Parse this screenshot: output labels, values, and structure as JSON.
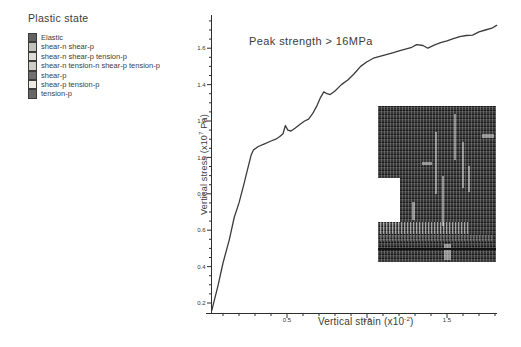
{
  "legend": {
    "title": "Plastic state",
    "items": [
      {
        "label": "Elastic",
        "color": "#636363"
      },
      {
        "label": "shear-n shear-p",
        "color": "#c3c1bd"
      },
      {
        "label": "shear-n shear-p tension-p",
        "color": "#dddcd7"
      },
      {
        "label": "shear-n tension-n shear-p tension-p",
        "color": "#cfcdc8"
      },
      {
        "label": "shear-p",
        "color": "#707070"
      },
      {
        "label": "shear-p tension-p",
        "color": "#edebe6"
      },
      {
        "label": "tension-p",
        "color": "#676765"
      }
    ]
  },
  "chart_data": {
    "type": "line",
    "title": "",
    "annotation": "Peak strength > 16MPa",
    "xlabel": "Vertical strain (x10⁻²)",
    "ylabel": "Vertical stress (x10⁷ Pa)",
    "xlabel_pre": "Vertical strain (x10",
    "xlabel_sup": "-2",
    "xlabel_post": ")",
    "ylabel_pre": "Vertical stress (x10",
    "ylabel_sup": "7",
    "ylabel_post": " Pa)",
    "xlim": [
      0,
      1.82
    ],
    "ylim": [
      0.14,
      1.78
    ],
    "x_ticks": [
      0.5,
      1.0,
      1.5
    ],
    "x_tick_labels": [
      "0.5",
      "1.0",
      "1.5"
    ],
    "x_minor_step": 0.1,
    "y_ticks": [
      0.2,
      0.4,
      0.6,
      0.8,
      1.0,
      1.2,
      1.4,
      1.6
    ],
    "y_tick_labels": [
      "0.2",
      "0.4",
      "0.6",
      "0.8",
      "1.0",
      "1.2",
      "1.4",
      "1.6"
    ],
    "y_minor_step": 0.05,
    "grid": false,
    "legend_position": "top-left",
    "series": [
      {
        "name": "vertical stress vs vertical strain",
        "x": [
          0.03,
          0.07,
          0.1,
          0.14,
          0.17,
          0.2,
          0.23,
          0.255,
          0.275,
          0.29,
          0.32,
          0.36,
          0.4,
          0.43,
          0.455,
          0.475,
          0.49,
          0.505,
          0.525,
          0.55,
          0.58,
          0.61,
          0.635,
          0.66,
          0.685,
          0.71,
          0.73,
          0.75,
          0.77,
          0.8,
          0.84,
          0.88,
          0.92,
          0.96,
          1.0,
          1.04,
          1.08,
          1.12,
          1.16,
          1.2,
          1.24,
          1.28,
          1.31,
          1.35,
          1.38,
          1.42,
          1.46,
          1.5,
          1.54,
          1.58,
          1.62,
          1.66,
          1.7,
          1.74,
          1.78,
          1.81
        ],
        "y": [
          0.16,
          0.3,
          0.42,
          0.55,
          0.67,
          0.75,
          0.85,
          0.94,
          1.01,
          1.04,
          1.06,
          1.075,
          1.09,
          1.1,
          1.115,
          1.13,
          1.175,
          1.15,
          1.145,
          1.16,
          1.18,
          1.2,
          1.21,
          1.24,
          1.28,
          1.33,
          1.36,
          1.35,
          1.345,
          1.365,
          1.4,
          1.425,
          1.46,
          1.5,
          1.525,
          1.545,
          1.555,
          1.565,
          1.575,
          1.585,
          1.595,
          1.605,
          1.62,
          1.615,
          1.6,
          1.617,
          1.63,
          1.64,
          1.652,
          1.664,
          1.67,
          1.672,
          1.69,
          1.7,
          1.71,
          1.725
        ]
      }
    ],
    "colors": {
      "curve": "#3b3b3b",
      "axis": "#2e2e2e",
      "text": "#3a3a3a",
      "inset_base": "#353535"
    }
  }
}
